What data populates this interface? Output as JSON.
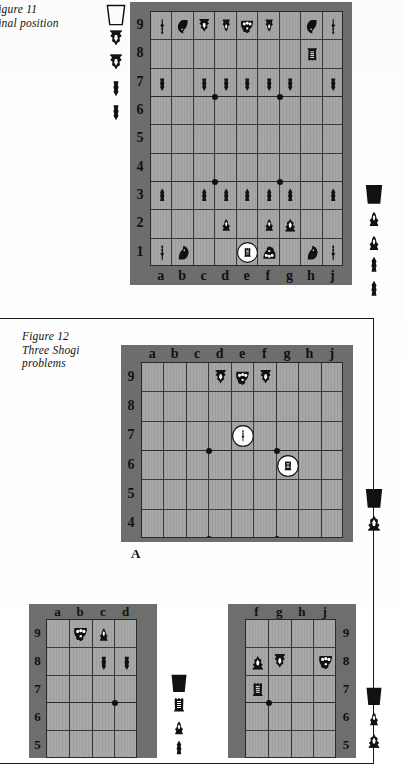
{
  "page": {
    "width": 403,
    "height": 758,
    "background": "#ffffff",
    "ink": "#111111",
    "board_border_color": "#6e6e6e",
    "board_field_color": "#a8a8a8",
    "grid_line_color": "#3a3a3a"
  },
  "figures": [
    {
      "id": "figure-11",
      "caption_line1": "Figure 11",
      "caption_line2": "Final position",
      "caption": "Figure 11\nFinal position",
      "board": {
        "files": [
          "a",
          "b",
          "c",
          "d",
          "e",
          "f",
          "g",
          "h",
          "j"
        ],
        "ranks": [
          "9",
          "8",
          "7",
          "6",
          "5",
          "4",
          "3",
          "2",
          "1"
        ],
        "file_labels_position": "bottom",
        "rank_labels_position": "left",
        "pieces": [
          {
            "file": "a",
            "rank": "9",
            "type": "lance",
            "side": "white",
            "promoted": false,
            "circled": false
          },
          {
            "file": "b",
            "rank": "9",
            "type": "knight",
            "side": "white",
            "promoted": false,
            "circled": false
          },
          {
            "file": "c",
            "rank": "9",
            "type": "gold",
            "side": "white",
            "promoted": false,
            "circled": false
          },
          {
            "file": "d",
            "rank": "9",
            "type": "silver",
            "side": "white",
            "promoted": false,
            "circled": false
          },
          {
            "file": "e",
            "rank": "9",
            "type": "king",
            "side": "white",
            "promoted": false,
            "circled": false
          },
          {
            "file": "f",
            "rank": "9",
            "type": "silver",
            "side": "white",
            "promoted": false,
            "circled": false
          },
          {
            "file": "h",
            "rank": "9",
            "type": "knight",
            "side": "white",
            "promoted": false,
            "circled": false
          },
          {
            "file": "j",
            "rank": "9",
            "type": "lance",
            "side": "white",
            "promoted": false,
            "circled": false
          },
          {
            "file": "h",
            "rank": "8",
            "type": "rook",
            "side": "white",
            "promoted": false,
            "circled": false
          },
          {
            "file": "a",
            "rank": "7",
            "type": "pawn",
            "side": "white",
            "promoted": false,
            "circled": false
          },
          {
            "file": "c",
            "rank": "7",
            "type": "pawn",
            "side": "white",
            "promoted": false,
            "circled": false
          },
          {
            "file": "d",
            "rank": "7",
            "type": "pawn",
            "side": "white",
            "promoted": false,
            "circled": false
          },
          {
            "file": "e",
            "rank": "7",
            "type": "pawn",
            "side": "white",
            "promoted": false,
            "circled": false
          },
          {
            "file": "f",
            "rank": "7",
            "type": "pawn",
            "side": "white",
            "promoted": false,
            "circled": false
          },
          {
            "file": "g",
            "rank": "7",
            "type": "pawn",
            "side": "white",
            "promoted": false,
            "circled": false
          },
          {
            "file": "j",
            "rank": "7",
            "type": "pawn",
            "side": "white",
            "promoted": false,
            "circled": false
          },
          {
            "file": "a",
            "rank": "3",
            "type": "pawn",
            "side": "black",
            "promoted": false,
            "circled": false
          },
          {
            "file": "c",
            "rank": "3",
            "type": "pawn",
            "side": "black",
            "promoted": false,
            "circled": false
          },
          {
            "file": "d",
            "rank": "3",
            "type": "pawn",
            "side": "black",
            "promoted": false,
            "circled": false
          },
          {
            "file": "e",
            "rank": "3",
            "type": "pawn",
            "side": "black",
            "promoted": false,
            "circled": false
          },
          {
            "file": "f",
            "rank": "3",
            "type": "pawn",
            "side": "black",
            "promoted": false,
            "circled": false
          },
          {
            "file": "g",
            "rank": "3",
            "type": "pawn",
            "side": "black",
            "promoted": false,
            "circled": false
          },
          {
            "file": "j",
            "rank": "3",
            "type": "pawn",
            "side": "black",
            "promoted": false,
            "circled": false
          },
          {
            "file": "d",
            "rank": "2",
            "type": "silver",
            "side": "black",
            "promoted": false,
            "circled": false
          },
          {
            "file": "f",
            "rank": "2",
            "type": "silver",
            "side": "black",
            "promoted": false,
            "circled": false
          },
          {
            "file": "g",
            "rank": "2",
            "type": "gold",
            "side": "black",
            "promoted": false,
            "circled": false
          },
          {
            "file": "a",
            "rank": "1",
            "type": "lance",
            "side": "black",
            "promoted": false,
            "circled": false
          },
          {
            "file": "b",
            "rank": "1",
            "type": "knight",
            "side": "black",
            "promoted": false,
            "circled": false
          },
          {
            "file": "e",
            "rank": "1",
            "type": "rook",
            "side": "black",
            "promoted": false,
            "circled": true
          },
          {
            "file": "f",
            "rank": "1",
            "type": "king",
            "side": "black",
            "promoted": false,
            "circled": false
          },
          {
            "file": "h",
            "rank": "1",
            "type": "knight",
            "side": "black",
            "promoted": false,
            "circled": false
          },
          {
            "file": "j",
            "rank": "1",
            "type": "lance",
            "side": "black",
            "promoted": false,
            "circled": false
          }
        ],
        "star_points": [
          {
            "file": "c",
            "rank": "7"
          },
          {
            "file": "f",
            "rank": "7"
          },
          {
            "file": "c",
            "rank": "4"
          },
          {
            "file": "f",
            "rank": "4"
          }
        ]
      },
      "hand_white": {
        "label": "White pieces in hand",
        "stand": "empty-stand",
        "pieces": [
          "pawn",
          "pawn",
          "gold",
          "gold"
        ]
      },
      "hand_black": {
        "label": "Black pieces in hand",
        "stand": "filled-stand",
        "pieces": [
          "silver",
          "silver",
          "pawn",
          "pawn"
        ]
      }
    },
    {
      "id": "figure-12",
      "caption_line1": "Figure 12",
      "caption_line2": "Three Shogi",
      "caption_line3": "problems",
      "caption": "Figure 12\nThree Shogi\nproblems",
      "problems": [
        {
          "id": "problem-a",
          "label": "A",
          "files": [
            "a",
            "b",
            "c",
            "d",
            "e",
            "f",
            "g",
            "h",
            "j"
          ],
          "ranks": [
            "9",
            "8",
            "7",
            "6",
            "5",
            "4"
          ],
          "file_labels_position": "top",
          "rank_labels_position": "left",
          "pieces": [
            {
              "file": "d",
              "rank": "9",
              "type": "gold",
              "side": "white",
              "circled": false
            },
            {
              "file": "e",
              "rank": "9",
              "type": "king",
              "side": "white",
              "circled": false
            },
            {
              "file": "f",
              "rank": "9",
              "type": "gold",
              "side": "white",
              "circled": false
            },
            {
              "file": "e",
              "rank": "7",
              "type": "lance",
              "side": "black",
              "circled": true
            },
            {
              "file": "g",
              "rank": "6",
              "type": "rook",
              "side": "black",
              "circled": true
            }
          ],
          "star_points": [
            {
              "file": "c",
              "rank": "7"
            },
            {
              "file": "f",
              "rank": "7"
            },
            {
              "file": "c",
              "rank": "4"
            },
            {
              "file": "f",
              "rank": "4"
            }
          ],
          "hand": {
            "stand": "filled-stand",
            "pieces": [
              "gold"
            ]
          }
        },
        {
          "id": "problem-b",
          "label": "B",
          "files": [
            "a",
            "b",
            "c",
            "d"
          ],
          "ranks": [
            "9",
            "8",
            "7",
            "6",
            "5"
          ],
          "file_labels_position": "top",
          "rank_labels_position": "left",
          "pieces": [
            {
              "file": "b",
              "rank": "9",
              "type": "king",
              "side": "white",
              "circled": false
            },
            {
              "file": "c",
              "rank": "9",
              "type": "silver",
              "side": "black",
              "circled": false
            },
            {
              "file": "c",
              "rank": "8",
              "type": "pawn",
              "side": "white",
              "circled": false
            },
            {
              "file": "d",
              "rank": "8",
              "type": "pawn",
              "side": "white",
              "circled": false
            }
          ],
          "star_points": [
            {
              "file": "c",
              "rank": "7"
            }
          ],
          "hand": {
            "stand": "filled-stand",
            "pieces": [
              "rook",
              "silver",
              "pawn"
            ]
          }
        },
        {
          "id": "problem-c",
          "label": "C",
          "files": [
            "f",
            "g",
            "h",
            "j"
          ],
          "ranks": [
            "9",
            "8",
            "7",
            "6",
            "5"
          ],
          "file_labels_position": "top",
          "rank_labels_position": "right",
          "pieces": [
            {
              "file": "f",
              "rank": "8",
              "type": "gold",
              "side": "black",
              "circled": false
            },
            {
              "file": "g",
              "rank": "8",
              "type": "gold",
              "side": "white",
              "circled": false
            },
            {
              "file": "j",
              "rank": "8",
              "type": "king",
              "side": "white",
              "circled": false
            },
            {
              "file": "f",
              "rank": "7",
              "type": "rook",
              "side": "black",
              "circled": false
            }
          ],
          "star_points": [
            {
              "file": "f",
              "rank": "7"
            }
          ],
          "hand": {
            "stand": "filled-stand",
            "pieces": [
              "silver",
              "gold"
            ]
          }
        }
      ]
    }
  ]
}
